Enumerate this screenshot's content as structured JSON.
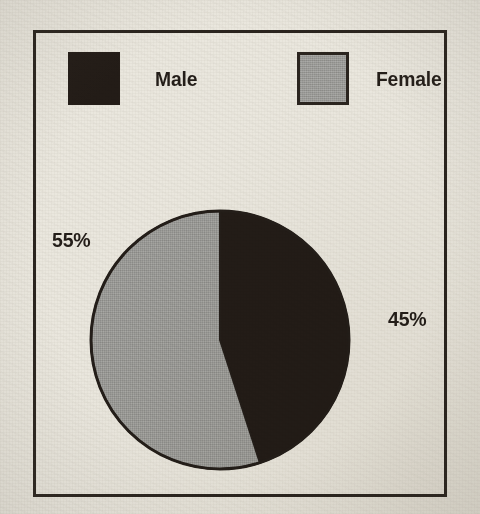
{
  "figure": {
    "background_color": "#eae7de",
    "frame_color": "#2a241e"
  },
  "legend": {
    "items": [
      {
        "label": "Male",
        "color": "#231c17",
        "swatch_name": "legend-swatch-male"
      },
      {
        "label": "Female",
        "color": "#9b9b98",
        "swatch_name": "legend-swatch-female"
      }
    ]
  },
  "labels": {
    "female_pct": "55%",
    "male_pct": "45%"
  },
  "chart_data": {
    "type": "pie",
    "title": "",
    "categories": [
      "Male",
      "Female"
    ],
    "values": [
      45,
      55
    ],
    "value_labels": [
      "45%",
      "55%"
    ],
    "colors": [
      "#231c17",
      "#9b9b98"
    ],
    "units": "percent",
    "total": 100,
    "start_angle_deg": 0,
    "direction": "clockwise",
    "legend": {
      "position": "top",
      "entries": [
        "Male",
        "Female"
      ]
    },
    "slices": [
      {
        "name": "Male",
        "value": 45,
        "label": "45%",
        "color": "#231c17",
        "label_position": "right"
      },
      {
        "name": "Female",
        "value": 55,
        "label": "55%",
        "color": "#9b9b98",
        "label_position": "left"
      }
    ],
    "grid": false,
    "xlabel": "",
    "ylabel": ""
  }
}
